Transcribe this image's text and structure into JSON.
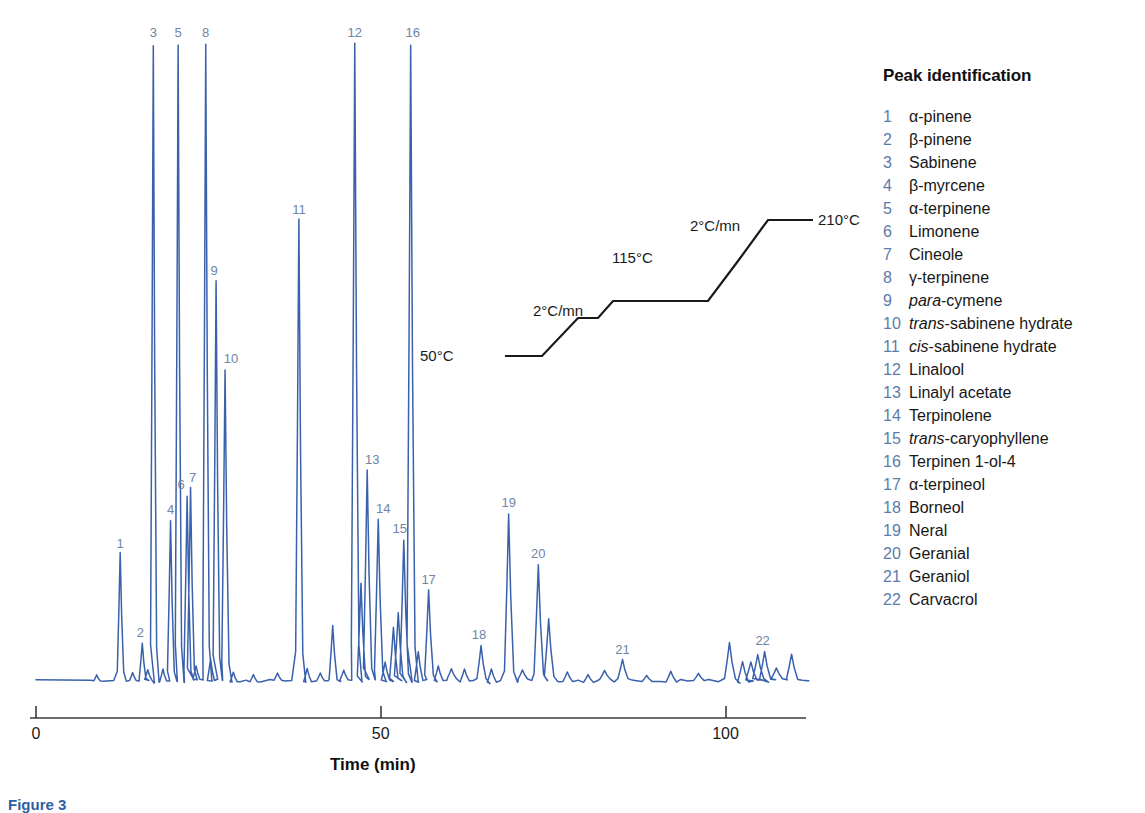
{
  "colors": {
    "trace": "#3a61ab",
    "peak_label": "#6f84a6",
    "legend_number": "#5c7ca9",
    "axis": "#3b3b3b",
    "text": "#171717",
    "caption": "#2e5fa3"
  },
  "axis": {
    "title": "Time (min)",
    "ticks": [
      {
        "value": 0,
        "label": "0"
      },
      {
        "value": 50,
        "label": "50"
      },
      {
        "value": 100,
        "label": "100"
      }
    ],
    "range": [
      0,
      112
    ]
  },
  "temperature_program": {
    "start_label": "50°C",
    "ramp1_label": "2°C/mn",
    "hold_label": "115°C",
    "ramp2_label": "2°C/mn",
    "end_label": "210°C"
  },
  "legend": {
    "title": "Peak identification",
    "items": [
      {
        "num": "1",
        "name": "α-pinene",
        "italic_prefix": ""
      },
      {
        "num": "2",
        "name": "β-pinene",
        "italic_prefix": ""
      },
      {
        "num": "3",
        "name": "Sabinene",
        "italic_prefix": ""
      },
      {
        "num": "4",
        "name": "β-myrcene",
        "italic_prefix": ""
      },
      {
        "num": "5",
        "name": "α-terpinene",
        "italic_prefix": ""
      },
      {
        "num": "6",
        "name": "Limonene",
        "italic_prefix": ""
      },
      {
        "num": "7",
        "name": "Cineole",
        "italic_prefix": ""
      },
      {
        "num": "8",
        "name": "γ-terpinene",
        "italic_prefix": ""
      },
      {
        "num": "9",
        "name": "-cymene",
        "italic_prefix": "para"
      },
      {
        "num": "10",
        "name": "-sabinene hydrate",
        "italic_prefix": "trans"
      },
      {
        "num": "11",
        "name": "-sabinene hydrate",
        "italic_prefix": "cis"
      },
      {
        "num": "12",
        "name": "Linalool",
        "italic_prefix": ""
      },
      {
        "num": "13",
        "name": "Linalyl acetate",
        "italic_prefix": ""
      },
      {
        "num": "14",
        "name": "Terpinolene",
        "italic_prefix": ""
      },
      {
        "num": "15",
        "name": "-caryophyllene",
        "italic_prefix": "trans"
      },
      {
        "num": "16",
        "name": "Terpinen 1-ol-4",
        "italic_prefix": ""
      },
      {
        "num": "17",
        "name": "α-terpineol",
        "italic_prefix": ""
      },
      {
        "num": "18",
        "name": "Borneol",
        "italic_prefix": ""
      },
      {
        "num": "19",
        "name": "Neral",
        "italic_prefix": ""
      },
      {
        "num": "20",
        "name": "Geranial",
        "italic_prefix": ""
      },
      {
        "num": "21",
        "name": "Geraniol",
        "italic_prefix": ""
      },
      {
        "num": "22",
        "name": "Carvacrol",
        "italic_prefix": ""
      }
    ]
  },
  "caption": "Figure 3",
  "chart_data": {
    "type": "line",
    "title": "",
    "xlabel": "Time (min)",
    "ylabel": "",
    "xlim": [
      0,
      112
    ],
    "ylim": [
      0,
      1
    ],
    "grid": false,
    "legend_position": "right",
    "series": [
      {
        "name": "GC chromatogram (FID response)",
        "comment": "peaks: retention time in min, relative height 0-1 (1 = top of frame)",
        "labeled_peaks": [
          {
            "id": "1",
            "compound": "α-pinene",
            "time": 12.2,
            "height": 0.198
          },
          {
            "id": "2",
            "compound": "β-pinene",
            "time": 15.4,
            "height": 0.058
          },
          {
            "id": "3",
            "compound": "Sabinene",
            "time": 17.0,
            "height": 1.0
          },
          {
            "id": "4",
            "compound": "β-myrcene",
            "time": 19.5,
            "height": 0.251
          },
          {
            "id": "5",
            "compound": "α-terpinene",
            "time": 20.6,
            "height": 1.0
          },
          {
            "id": "6",
            "compound": "Limonene",
            "time": 21.9,
            "height": 0.29
          },
          {
            "id": "7",
            "compound": "Cineole",
            "time": 22.4,
            "height": 0.302
          },
          {
            "id": "8",
            "compound": "γ-terpinene",
            "time": 24.6,
            "height": 1.0
          },
          {
            "id": "9",
            "compound": "para-cymene",
            "time": 26.1,
            "height": 0.626
          },
          {
            "id": "10",
            "compound": "trans-sabinene hydrate",
            "time": 27.4,
            "height": 0.488
          },
          {
            "id": "11",
            "compound": "cis-sabinene hydrate",
            "time": 38.1,
            "height": 0.722
          },
          {
            "id": "12",
            "compound": "Linalool",
            "time": 46.2,
            "height": 1.0
          },
          {
            "id": "13",
            "compound": "Linalyl acetate",
            "time": 48.0,
            "height": 0.33
          },
          {
            "id": "14",
            "compound": "Terpinolene",
            "time": 49.6,
            "height": 0.253
          },
          {
            "id": "15",
            "compound": "trans-caryophyllene",
            "time": 53.3,
            "height": 0.222
          },
          {
            "id": "16",
            "compound": "Terpinen 1-ol-4",
            "time": 54.3,
            "height": 1.0
          },
          {
            "id": "17",
            "compound": "α-terpineol",
            "time": 56.9,
            "height": 0.142
          },
          {
            "id": "18",
            "compound": "Borneol",
            "time": 64.5,
            "height": 0.055
          },
          {
            "id": "19",
            "compound": "Neral",
            "time": 68.5,
            "height": 0.262
          },
          {
            "id": "20",
            "compound": "Geranial",
            "time": 72.8,
            "height": 0.182
          },
          {
            "id": "21",
            "compound": "Geraniol",
            "time": 85.0,
            "height": 0.032
          },
          {
            "id": "22",
            "compound": "Carvacrol",
            "time": 105.6,
            "height": 0.046
          }
        ],
        "unlabeled_peaks": [
          {
            "time": 8.8,
            "height": 0.01
          },
          {
            "time": 14.0,
            "height": 0.013
          },
          {
            "time": 16.2,
            "height": 0.016
          },
          {
            "time": 18.4,
            "height": 0.02
          },
          {
            "time": 23.2,
            "height": 0.022
          },
          {
            "time": 25.3,
            "height": 0.036
          },
          {
            "time": 28.6,
            "height": 0.016
          },
          {
            "time": 31.5,
            "height": 0.012
          },
          {
            "time": 35.0,
            "height": 0.012
          },
          {
            "time": 39.3,
            "height": 0.022
          },
          {
            "time": 41.2,
            "height": 0.013
          },
          {
            "time": 43.0,
            "height": 0.09
          },
          {
            "time": 44.6,
            "height": 0.016
          },
          {
            "time": 47.1,
            "height": 0.155
          },
          {
            "time": 50.6,
            "height": 0.03
          },
          {
            "time": 51.8,
            "height": 0.085
          },
          {
            "time": 52.5,
            "height": 0.105
          },
          {
            "time": 55.4,
            "height": 0.048
          },
          {
            "time": 58.3,
            "height": 0.024
          },
          {
            "time": 60.2,
            "height": 0.016
          },
          {
            "time": 62.1,
            "height": 0.02
          },
          {
            "time": 66.0,
            "height": 0.022
          },
          {
            "time": 70.5,
            "height": 0.015
          },
          {
            "time": 74.3,
            "height": 0.096
          },
          {
            "time": 77.0,
            "height": 0.016
          },
          {
            "time": 80.0,
            "height": 0.013
          },
          {
            "time": 82.4,
            "height": 0.014
          },
          {
            "time": 88.5,
            "height": 0.01
          },
          {
            "time": 92.0,
            "height": 0.018
          },
          {
            "time": 96.0,
            "height": 0.012
          },
          {
            "time": 100.5,
            "height": 0.06
          },
          {
            "time": 102.4,
            "height": 0.034
          },
          {
            "time": 103.6,
            "height": 0.03
          },
          {
            "time": 104.6,
            "height": 0.04
          },
          {
            "time": 107.3,
            "height": 0.018
          },
          {
            "time": 109.5,
            "height": 0.042
          }
        ]
      }
    ]
  }
}
